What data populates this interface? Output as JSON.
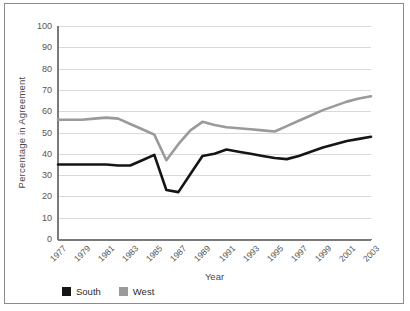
{
  "chart_data": {
    "type": "line",
    "title": "",
    "xlabel": "Year",
    "ylabel": "Percentage in Agreement",
    "ylim": [
      0,
      100
    ],
    "ytick_values": [
      0,
      10,
      20,
      30,
      40,
      50,
      60,
      70,
      80,
      90,
      100
    ],
    "ytick_labels": [
      "0",
      "10",
      "20",
      "30",
      "40",
      "50",
      "60",
      "70",
      "80",
      "90",
      "100"
    ],
    "xtick_labels": [
      "1977",
      "1979",
      "1981",
      "1983",
      "1985",
      "1987",
      "1989",
      "1991",
      "1993",
      "1995",
      "1997",
      "1999",
      "2001",
      "2003"
    ],
    "grid": "horizontal",
    "legend_position": "below-left",
    "x": [
      1977,
      1978,
      1979,
      1980,
      1981,
      1982,
      1983,
      1984,
      1985,
      1986,
      1987,
      1988,
      1989,
      1990,
      1991,
      1992,
      1993,
      1994,
      1995,
      1996,
      1997,
      1998,
      1999,
      2000,
      2001,
      2002,
      2003
    ],
    "series": [
      {
        "name": "South",
        "color": "#151515",
        "values": [
          35,
          35,
          35,
          35,
          35,
          34.5,
          34.5,
          37,
          39.5,
          23,
          22,
          30.5,
          39,
          40,
          42,
          41,
          40,
          39,
          38,
          37.5,
          39,
          41,
          43,
          44.5,
          46,
          47,
          48
        ]
      },
      {
        "name": "West",
        "color": "#9a9a9a",
        "values": [
          56,
          56,
          56,
          56.5,
          57,
          56.5,
          54,
          51.5,
          49,
          37,
          44.5,
          51,
          55,
          53.5,
          52.5,
          52,
          51.5,
          51,
          50.5,
          53,
          55.5,
          58,
          60.5,
          62.5,
          64.5,
          66,
          67
        ]
      }
    ]
  },
  "legend": {
    "items": [
      {
        "label": "South",
        "color": "#151515"
      },
      {
        "label": "West",
        "color": "#9a9a9a"
      }
    ]
  }
}
